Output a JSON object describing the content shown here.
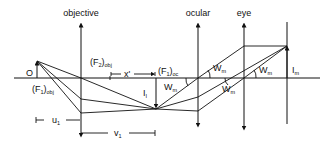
{
  "diagram": {
    "type": "compound-microscope-ray-diagram",
    "labels": {
      "objective": "objective",
      "ocular": "ocular",
      "eye": "eye",
      "object": "O",
      "f2_obj_main": "(F",
      "f2_obj_sub1": "2",
      "f2_obj_close": ")",
      "f2_obj_sub2": "obj",
      "f1_oc_main": "(F",
      "f1_oc_sub1": "1",
      "f1_oc_close": ")",
      "f1_oc_sub2": "oc",
      "f1_obj_main": "(F",
      "f1_obj_sub1": "1",
      "f1_obj_close": ")",
      "f1_obj_sub2": "obj",
      "x_prime": "x'",
      "intermediate_image_main": "I",
      "intermediate_image_sub": "I",
      "final_image_main": "I",
      "final_image_sub": "m",
      "angle_main": "W",
      "angle_sub": "m",
      "u1_main": "u",
      "u1_sub": "1",
      "v1_main": "v",
      "v1_sub": "1"
    },
    "colors": {
      "line": "#111111",
      "background": "#ffffff"
    }
  }
}
